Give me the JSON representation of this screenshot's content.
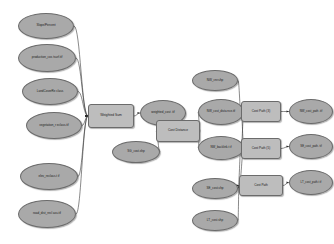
{
  "diagram": {
    "type": "workflow-model",
    "colors": {
      "data_fill": "#a9a9a9",
      "tool_fill": "#bdbdbd",
      "stroke": "#6b6b6b",
      "connector": "#3a3a3a",
      "background": "#ffffff"
    },
    "nodes": [
      {
        "id": "n1",
        "label": "Slope/Percent",
        "shape": "ellipse",
        "x": 18,
        "y": 13,
        "w": 56,
        "h": 26,
        "font": 3.3
      },
      {
        "id": "n2",
        "label": "production_cos tsurf.tif",
        "shape": "ellipse",
        "x": 18,
        "y": 44,
        "w": 58,
        "h": 28,
        "font": 3.3
      },
      {
        "id": "n3",
        "label": "LandCoverRe class",
        "shape": "ellipse",
        "x": 22,
        "y": 78,
        "w": 56,
        "h": 27,
        "font": 3.3
      },
      {
        "id": "n4",
        "label": "vegetation_r eclass.tif",
        "shape": "ellipse",
        "x": 26,
        "y": 112,
        "w": 56,
        "h": 27,
        "font": 3.3
      },
      {
        "id": "n5",
        "label": "elev_reclass.t if",
        "shape": "ellipse",
        "x": 20,
        "y": 163,
        "w": 58,
        "h": 27,
        "font": 3.3
      },
      {
        "id": "n6",
        "label": "road_dist_recl ass.tif",
        "shape": "ellipse",
        "x": 18,
        "y": 200,
        "w": 58,
        "h": 28,
        "font": 3.3
      },
      {
        "id": "n7",
        "label": "Weighted Sum",
        "shape": "rect",
        "x": 88,
        "y": 104,
        "w": 46,
        "h": 24,
        "font": 3.6
      },
      {
        "id": "n8",
        "label": "weighted_cost .tif",
        "shape": "ellipse",
        "x": 140,
        "y": 100,
        "w": 46,
        "h": 26,
        "font": 3.3
      },
      {
        "id": "n9",
        "label": "SG_cost.shp",
        "shape": "ellipse",
        "x": 112,
        "y": 141,
        "w": 48,
        "h": 22,
        "font": 3.3
      },
      {
        "id": "n10",
        "label": "Cost Distance",
        "shape": "rect",
        "x": 156,
        "y": 120,
        "w": 44,
        "h": 22,
        "font": 3.5
      },
      {
        "id": "n11",
        "label": "NW_cost_dista nce.tif",
        "shape": "ellipse",
        "x": 198,
        "y": 99,
        "w": 46,
        "h": 26,
        "font": 3.2
      },
      {
        "id": "n12",
        "label": "NW_backlink.t if",
        "shape": "ellipse",
        "x": 198,
        "y": 136,
        "w": 46,
        "h": 24,
        "font": 3.2
      },
      {
        "id": "n13",
        "label": "NW_cnr.shp",
        "shape": "ellipse",
        "x": 192,
        "y": 70,
        "w": 46,
        "h": 21,
        "font": 3.3
      },
      {
        "id": "n14",
        "label": "SE_cost.shp",
        "shape": "ellipse",
        "x": 192,
        "y": 178,
        "w": 46,
        "h": 21,
        "font": 3.3
      },
      {
        "id": "n15",
        "label": "LT_cost.shp",
        "shape": "ellipse",
        "x": 192,
        "y": 210,
        "w": 46,
        "h": 21,
        "font": 3.3
      },
      {
        "id": "n16",
        "label": "Cost Path (3)",
        "shape": "rect",
        "x": 241,
        "y": 101,
        "w": 40,
        "h": 21,
        "font": 3.4
      },
      {
        "id": "n17",
        "label": "Cost Path (5)",
        "shape": "rect",
        "x": 241,
        "y": 138,
        "w": 40,
        "h": 21,
        "font": 3.4
      },
      {
        "id": "n18",
        "label": "Cost Path",
        "shape": "rect",
        "x": 239,
        "y": 175,
        "w": 44,
        "h": 21,
        "font": 3.4
      },
      {
        "id": "n19",
        "label": "NW_cost_path .tif",
        "shape": "ellipse",
        "x": 289,
        "y": 99,
        "w": 44,
        "h": 25,
        "font": 3.1
      },
      {
        "id": "n20",
        "label": "SE_cost_path. tif",
        "shape": "ellipse",
        "x": 289,
        "y": 134,
        "w": 44,
        "h": 25,
        "font": 3.1
      },
      {
        "id": "n21",
        "label": "LT_cost_path.t if",
        "shape": "ellipse",
        "x": 289,
        "y": 170,
        "w": 44,
        "h": 25,
        "font": 3.1
      }
    ],
    "edges": [
      {
        "from": "n1",
        "to": "n7"
      },
      {
        "from": "n2",
        "to": "n7"
      },
      {
        "from": "n3",
        "to": "n7"
      },
      {
        "from": "n4",
        "to": "n7"
      },
      {
        "from": "n5",
        "to": "n7"
      },
      {
        "from": "n6",
        "to": "n7"
      },
      {
        "from": "n7",
        "to": "n8"
      },
      {
        "from": "n8",
        "to": "n10"
      },
      {
        "from": "n9",
        "to": "n10"
      },
      {
        "from": "n10",
        "to": "n11"
      },
      {
        "from": "n10",
        "to": "n12"
      },
      {
        "from": "n13",
        "to": "n16"
      },
      {
        "from": "n11",
        "to": "n16"
      },
      {
        "from": "n12",
        "to": "n16"
      },
      {
        "from": "n11",
        "to": "n17"
      },
      {
        "from": "n12",
        "to": "n17"
      },
      {
        "from": "n14",
        "to": "n17"
      },
      {
        "from": "n12",
        "to": "n18"
      },
      {
        "from": "n14",
        "to": "n18"
      },
      {
        "from": "n15",
        "to": "n18"
      },
      {
        "from": "n16",
        "to": "n19"
      },
      {
        "from": "n17",
        "to": "n20"
      },
      {
        "from": "n18",
        "to": "n21"
      }
    ]
  }
}
